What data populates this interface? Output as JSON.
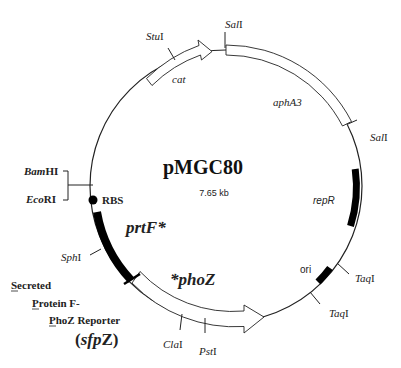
{
  "plasmid": {
    "name": "pMGC80",
    "size": "7.65 kb"
  },
  "genes": {
    "cat": "cat",
    "aphA3": "aphA3",
    "repR": "repR",
    "ori": "ori",
    "prtF": "prtF*",
    "phoZ": "*phoZ",
    "rbs": "RBS"
  },
  "sites": {
    "stuI": {
      "italic": "Stu",
      "roman": "I"
    },
    "salI_top": {
      "italic": "Sal",
      "roman": "I"
    },
    "salI_right": {
      "italic": "Sal",
      "roman": "I"
    },
    "taqI_upper": {
      "italic": "Taq",
      "roman": "I"
    },
    "taqI_lower": {
      "italic": "Taq",
      "roman": "I"
    },
    "pstI": {
      "italic": "Pst",
      "roman": "I"
    },
    "claI": {
      "italic": "Cla",
      "roman": "I"
    },
    "sphI": {
      "italic": "Sph",
      "roman": "I"
    },
    "bamHI": {
      "italic": "Bam",
      "roman": "HI"
    },
    "ecoRI": {
      "italic": "Eco",
      "roman": "RI"
    }
  },
  "reporter": {
    "line1": "Secreted",
    "line2": "Protein F-",
    "line3": "PhoZ Reporter",
    "abbrev_open": "(",
    "abbrev_italic": "sfp",
    "abbrev_roman": "Z",
    "abbrev_close": ")"
  },
  "colors": {
    "line": "#222222",
    "fill_dark": "#000000",
    "fill_light": "#ffffff"
  }
}
